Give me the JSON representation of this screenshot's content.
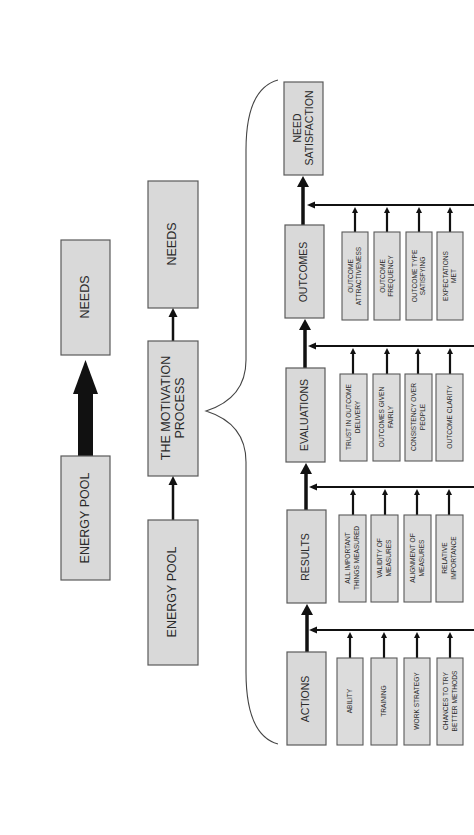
{
  "diagram": {
    "orientation": "rotated-90-ccw",
    "colors": {
      "box_fill": "#d9d9d9",
      "box_stroke": "#5a5a5a",
      "arrow": "#111111",
      "brace": "#444444",
      "background": "#ffffff"
    },
    "simple_model": {
      "from": "ENERGY POOL",
      "to": "NEEDS",
      "arrow_style": "thick"
    },
    "process_model": {
      "nodes": [
        "ENERGY POOL",
        "THE MOTIVATION",
        "PROCESS",
        "NEEDS"
      ],
      "energy_pool": "ENERGY POOL",
      "process_line1": "THE MOTIVATION",
      "process_line2": "PROCESS",
      "needs": "NEEDS"
    },
    "expanded_process": {
      "need_satisfaction": {
        "line1": "NEED",
        "line2": "SATISFACTION"
      },
      "stages": [
        {
          "label": "OUTCOMES",
          "factors": [
            {
              "line1": "OUTCOME",
              "line2": "ATTRACTIVENESS"
            },
            {
              "line1": "OUTCOME",
              "line2": "FREQUENCY"
            },
            {
              "line1": "OUTCOME TYPE",
              "line2": "SATISFYING"
            },
            {
              "line1": "EXPECTATIONS",
              "line2": "MET"
            }
          ]
        },
        {
          "label": "EVALUATIONS",
          "factors": [
            {
              "line1": "TRUST IN OUTCOME",
              "line2": "DELIVERY"
            },
            {
              "line1": "OUTCOMES GIVEN",
              "line2": "FAIRLY"
            },
            {
              "line1": "CONSISTENCY OVER",
              "line2": "PEOPLE"
            },
            {
              "line1": "OUTCOME CLARITY",
              "line2": ""
            }
          ]
        },
        {
          "label": "RESULTS",
          "factors": [
            {
              "line1": "ALL IMPORTANT",
              "line2": "THINGS MEASURED"
            },
            {
              "line1": "VALIDITY OF",
              "line2": "MEASURES"
            },
            {
              "line1": "ALIGNMENT OF",
              "line2": "MEASURES"
            },
            {
              "line1": "RELATIVE",
              "line2": "IMPORTANCE"
            }
          ]
        },
        {
          "label": "ACTIONS",
          "factors": [
            {
              "line1": "ABILITY",
              "line2": ""
            },
            {
              "line1": "TRAINING",
              "line2": ""
            },
            {
              "line1": "WORK STRATEGY",
              "line2": ""
            },
            {
              "line1": "CHANCES TO TRY",
              "line2": "BETTER METHODS"
            }
          ]
        }
      ]
    }
  }
}
